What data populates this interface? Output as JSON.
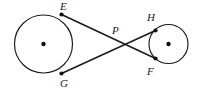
{
  "figure": {
    "width": 198,
    "height": 92,
    "background_color": "#ffffff",
    "stroke_color": "#1a1a1a",
    "dot_color": "#111111"
  },
  "circles": [
    {
      "name": "large-circle",
      "cx": 43.5,
      "cy": 44,
      "r": 29,
      "center_dot_r": 2.2
    },
    {
      "name": "small-circle",
      "cx": 168.5,
      "cy": 44,
      "r": 19.5,
      "center_dot_r": 2.2
    }
  ],
  "points": [
    {
      "id": "E",
      "label": "E",
      "x": 61.5,
      "y": 14.5,
      "dot_r": 2.1,
      "label_x": 60,
      "label_y": 1
    },
    {
      "id": "G",
      "label": "G",
      "x": 61.5,
      "y": 73.5,
      "dot_r": 2.1,
      "label_x": 60,
      "label_y": 78
    },
    {
      "id": "P",
      "label": "P",
      "x": 113,
      "y": 44,
      "dot_r": 0,
      "label_x": 112,
      "label_y": 25
    },
    {
      "id": "H",
      "label": "H",
      "x": 155.5,
      "y": 30.5,
      "dot_r": 2.1,
      "label_x": 147,
      "label_y": 12
    },
    {
      "id": "F",
      "label": "F",
      "x": 155.5,
      "y": 58.5,
      "dot_r": 2.1,
      "label_x": 147,
      "label_y": 66
    }
  ],
  "tangent_lines": [
    {
      "name": "tangent-E-to-F",
      "from": "E",
      "to": "F",
      "x1": 61.5,
      "y1": 14.5,
      "x2": 155.5,
      "y2": 58.5
    },
    {
      "name": "tangent-G-to-H",
      "from": "G",
      "to": "H",
      "x1": 61.5,
      "y1": 73.5,
      "x2": 155.5,
      "y2": 30.5
    }
  ]
}
